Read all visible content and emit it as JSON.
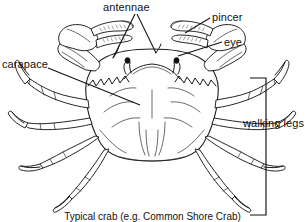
{
  "figure": {
    "title": "Typical crab (e.g. Common Shore Crab)",
    "subject": "crab",
    "view": "dorsal",
    "background_color": "#ffffff",
    "ink_color": "#1a1a1a",
    "width": 305,
    "height": 222
  },
  "labels": {
    "antennae": "antennae",
    "pincer": "pincer",
    "eye": "eye",
    "carapace": "carapace",
    "walking_legs": "walking legs"
  },
  "caption": "Typical crab (e.g. Common Shore Crab)",
  "anatomy": {
    "parts": [
      {
        "name": "antennae",
        "label": "antennae",
        "count": 2,
        "label_position": "top-center",
        "leader_style": "double-v"
      },
      {
        "name": "pincer",
        "label": "pincer",
        "count": 2,
        "label_position": "top-right",
        "leader_style": "single-line"
      },
      {
        "name": "eye",
        "label": "eye",
        "count": 2,
        "label_position": "right",
        "leader_style": "single-line"
      },
      {
        "name": "carapace",
        "label": "carapace",
        "count": 1,
        "label_position": "left",
        "leader_style": "single-line"
      },
      {
        "name": "walking legs",
        "label": "walking legs",
        "count": 8,
        "label_position": "right",
        "leader_style": "bracket"
      }
    ]
  }
}
